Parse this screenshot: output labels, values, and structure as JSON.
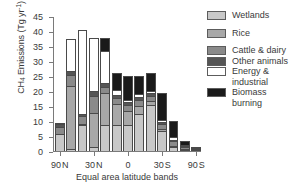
{
  "chart_data": {
    "type": "bar",
    "subtype": "stacked",
    "title": "",
    "xlabel": "Equal area latitude bands",
    "ylabel": "CH4 Emissions (Tg yr-1)",
    "ylabel_parts": {
      "prefix": "CH",
      "sub": "4",
      "mid": " Emissions (Tg yr",
      "sup": "-1",
      "suffix": ")"
    },
    "ylim": [
      0,
      45
    ],
    "yticks": [
      0,
      5,
      10,
      15,
      20,
      25,
      30,
      35,
      40,
      45
    ],
    "ytick_labels": [
      "0",
      "5",
      "10",
      "15",
      "20",
      "25",
      "30",
      "35",
      "40",
      "45"
    ],
    "grid": false,
    "legend_position": "right",
    "xtick_labels": [
      "90 N",
      "30 N",
      "0",
      "30 S",
      "90 S"
    ],
    "xtick_positions": [
      0,
      3,
      6,
      9,
      12
    ],
    "categories": [
      "90N",
      "b2",
      "b3",
      "30N",
      "b5",
      "b6",
      "0",
      "b8",
      "b9",
      "30S",
      "b11",
      "b12",
      "90S"
    ],
    "series": [
      {
        "name": "Wetlands",
        "color": "#c8c8c8",
        "values": [
          5.6,
          0.8,
          8.6,
          1.5,
          8.6,
          8.6,
          8.8,
          12.5,
          15.4,
          6.6,
          1.4,
          0.5,
          0.0
        ]
      },
      {
        "name": "Rice",
        "color": "#a8a8a8",
        "values": [
          0.0,
          21.0,
          0.4,
          11.3,
          10.6,
          7.0,
          4.7,
          2.6,
          1.4,
          0.9,
          0.4,
          0.2,
          0.0
        ]
      },
      {
        "name": "Cattle & dairy",
        "color": "#8a8a8a",
        "values": [
          2.5,
          3.5,
          2.8,
          5.4,
          2.0,
          2.0,
          1.7,
          1.9,
          1.7,
          1.6,
          1.5,
          0.5,
          0.2
        ]
      },
      {
        "name": "Other animals",
        "color": "#555555",
        "values": [
          0.8,
          1.5,
          0.4,
          1.7,
          1.4,
          1.2,
          1.0,
          1.0,
          0.8,
          0.7,
          0.5,
          0.3,
          0.1
        ]
      },
      {
        "name": "Energy & industrial",
        "color": "#ffffff",
        "values": [
          0.2,
          10.6,
          28.2,
          17.8,
          10.8,
          1.6,
          0.8,
          1.0,
          0.6,
          0.6,
          0.8,
          0.3,
          0.1
        ]
      },
      {
        "name": "Biomass burning",
        "color": "#1a1a1a",
        "values": [
          0.0,
          0.0,
          0.0,
          0.0,
          4.2,
          5.5,
          8.0,
          6.0,
          6.0,
          9.0,
          5.5,
          1.5,
          0.4
        ]
      }
    ]
  },
  "legend": {
    "items": [
      {
        "label": "Wetlands"
      },
      {
        "label": "Rice"
      },
      {
        "label": "Cattle & dairy"
      },
      {
        "label": "Other animals"
      },
      {
        "label": "Energy & industrial"
      },
      {
        "label": "Biomass burning"
      }
    ]
  }
}
